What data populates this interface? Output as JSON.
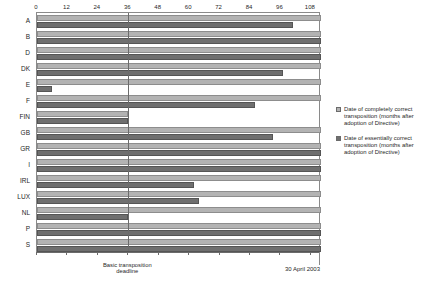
{
  "chart_data": {
    "type": "bar",
    "orientation": "horizontal",
    "title": "",
    "xlabel": "",
    "ylabel": "",
    "xlim": [
      0,
      112
    ],
    "grid": false,
    "legend_position": "right",
    "categories": [
      "A",
      "B",
      "D",
      "DK",
      "E",
      "F",
      "FIN",
      "GB",
      "GR",
      "I",
      "IRL",
      "LUX",
      "NL",
      "P",
      "S"
    ],
    "xticks": [
      0,
      12,
      24,
      36,
      48,
      60,
      72,
      84,
      96,
      108
    ],
    "xticklabels": [
      "0",
      "12",
      "24",
      "36",
      "48",
      "60",
      "72",
      "84",
      "96",
      "108"
    ],
    "series": [
      {
        "name": "Date of completely correct transposition (months after adoption of Directive)",
        "color": "#b3b3b3",
        "values": [
          112,
          112,
          112,
          112,
          112,
          112,
          36,
          112,
          112,
          112,
          112,
          112,
          112,
          112,
          112
        ]
      },
      {
        "name": "Date of essentially correct transposition (months after adoption of Directive)",
        "color": "#6f6f6f",
        "values": [
          101,
          112,
          112,
          97,
          6,
          86,
          36,
          93,
          112,
          112,
          62,
          64,
          36,
          112,
          112
        ]
      }
    ],
    "annotations": [
      {
        "name": "deadline-line",
        "x": 36,
        "label": "Basic transposition\ndeadline"
      },
      {
        "name": "end-of-period",
        "x": 112,
        "label": "30 April 2003"
      }
    ]
  },
  "legend": {
    "items": [
      {
        "swatch": "light",
        "label": "Date of completely correct transposition (months after adoption of Directive)"
      },
      {
        "swatch": "dark",
        "label": "Date of essentially correct transposition (months after adoption of Directive)"
      }
    ]
  },
  "axis": {
    "deadline_caption": "Basic transposition\ndeadline",
    "end_caption": "30 April 2003"
  }
}
